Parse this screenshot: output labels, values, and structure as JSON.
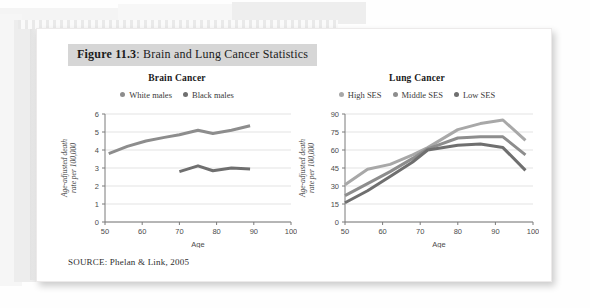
{
  "figure": {
    "number_label": "Figure 11.3",
    "title_rest": ": Brain and Lung Cancer Statistics",
    "source": "SOURCE: Phelan & Link, 2005"
  },
  "colors": {
    "title_band": "#d6d6d6",
    "series_dark_gray": "#6f6f6f",
    "series_mid_gray": "#8d8d8d",
    "series_light_gray": "#a8a8a8",
    "gridline": "#dcdcdc",
    "axis": "#7a7a7a"
  },
  "chart_data": [
    {
      "type": "line",
      "title": "Brain Cancer",
      "xlabel": "Age",
      "ylabel": "Age-adjusted death rate per 100,000",
      "xlim": [
        50,
        100
      ],
      "ylim": [
        0,
        6
      ],
      "xticks": [
        50,
        60,
        70,
        80,
        90,
        100
      ],
      "yticks": [
        0,
        1,
        2,
        3,
        4,
        5,
        6
      ],
      "grid": true,
      "legend_position": "top",
      "series": [
        {
          "name": "White males",
          "color": "#8d8d8d",
          "x": [
            51,
            56,
            61,
            66,
            70,
            75,
            79,
            84,
            89
          ],
          "values": [
            3.8,
            4.2,
            4.5,
            4.7,
            4.85,
            5.1,
            4.92,
            5.1,
            5.35
          ]
        },
        {
          "name": "Black males",
          "color": "#6f6f6f",
          "x": [
            70,
            75,
            79,
            84,
            89
          ],
          "values": [
            2.8,
            3.12,
            2.85,
            3.0,
            2.95
          ]
        }
      ]
    },
    {
      "type": "line",
      "title": "Lung Cancer",
      "xlabel": "Age",
      "ylabel": "Age-adjusted death rate per 100,000",
      "xlim": [
        50,
        100
      ],
      "ylim": [
        0,
        90
      ],
      "xticks": [
        50,
        60,
        70,
        80,
        90,
        100
      ],
      "yticks": [
        0,
        15,
        30,
        45,
        60,
        75,
        90
      ],
      "grid": true,
      "legend_position": "top",
      "series": [
        {
          "name": "High SES",
          "color": "#a8a8a8",
          "x": [
            50,
            56,
            62,
            68,
            72,
            80,
            86,
            92,
            98
          ],
          "values": [
            31,
            44,
            48,
            56,
            62,
            77,
            82,
            85,
            68
          ]
        },
        {
          "name": "Middle SES",
          "color": "#8d8d8d",
          "x": [
            50,
            56,
            62,
            68,
            72,
            80,
            86,
            92,
            98
          ],
          "values": [
            22,
            32,
            42,
            53,
            61,
            70,
            71,
            71,
            56
          ]
        },
        {
          "name": "Low SES",
          "color": "#6f6f6f",
          "x": [
            50,
            56,
            62,
            68,
            72,
            80,
            86,
            92,
            98
          ],
          "values": [
            16,
            26,
            38,
            50,
            60,
            64,
            65,
            62,
            43
          ]
        }
      ]
    }
  ]
}
